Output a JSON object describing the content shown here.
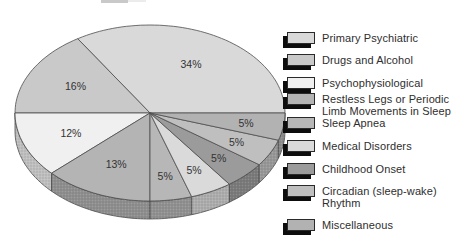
{
  "chart_data": {
    "type": "pie",
    "style": "3d-ellipse-grayscale",
    "title": "",
    "legend_position": "right",
    "start_angle_deg": 0,
    "direction": "counterclockwise",
    "stroke_color": "#4d4d4d",
    "label_color": "#333333",
    "slices": [
      {
        "label": "Primary Psychiatric",
        "value": 34,
        "pct_label": "34%",
        "color": "#d9d9d9"
      },
      {
        "label": "Drugs and Alcohol",
        "value": 16,
        "pct_label": "16%",
        "color": "#c9c9c9"
      },
      {
        "label": "Psychophysiological",
        "value": 12,
        "pct_label": "12%",
        "color": "#f0f0f0"
      },
      {
        "label": "Restless Legs or Periodic Limb Movements in Sleep",
        "label_wrap": "Restless Legs or Periodic\nLimb Movements in Sleep",
        "value": 13,
        "pct_label": "13%",
        "color": "#b4b4b4"
      },
      {
        "label": "Sleep Apnea",
        "value": 5,
        "pct_label": "5%",
        "color": "#b7b7b7"
      },
      {
        "label": "Medical Disorders",
        "value": 5,
        "pct_label": "5%",
        "color": "#dadada"
      },
      {
        "label": "Childhood Onset",
        "value": 5,
        "pct_label": "5%",
        "color": "#9b9b9b"
      },
      {
        "label": "Circadian (sleep-wake) Rhythm",
        "label_wrap": "Circadian (sleep-wake)\nRhythm",
        "value": 5,
        "pct_label": "5%",
        "color": "#bfbfbf"
      },
      {
        "label": "Miscellaneous",
        "value": 5,
        "pct_label": "5%",
        "color": "#b2b2b2"
      }
    ]
  }
}
